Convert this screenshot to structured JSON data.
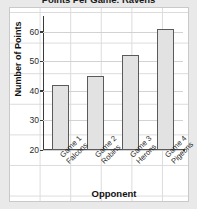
{
  "chart_data": {
    "type": "bar",
    "title": "Points Per Game: Ravens",
    "xlabel": "Opponent",
    "ylabel": "Number of Points",
    "categories": [
      "Game 1 Falcons",
      "Game 2 Robins",
      "Game 3 Herons",
      "Game 4 Pigeons"
    ],
    "category_lines": [
      {
        "line1": "Game 1",
        "line2": "Falcons"
      },
      {
        "line1": "Game 2",
        "line2": "Robins"
      },
      {
        "line1": "Game 3",
        "line2": "Herons"
      },
      {
        "line1": "Game 4",
        "line2": "Pigeons"
      }
    ],
    "values": [
      42,
      45,
      52,
      61
    ],
    "ylim": [
      20,
      64
    ],
    "yticks": [
      20,
      30,
      40,
      50,
      60
    ],
    "ytick_labels": [
      "20",
      "30",
      "40",
      "50",
      "60"
    ],
    "grid": true,
    "legend": null,
    "colors": {
      "bar_fill": "#e2e2e2",
      "bar_edge": "#5a5a5a",
      "panel_bg": "#ffffff",
      "page_bg": "#e9e9e9",
      "grid": "#d2d2d2",
      "axis": "#3a3a3a",
      "text": "#1a1a1a"
    }
  }
}
